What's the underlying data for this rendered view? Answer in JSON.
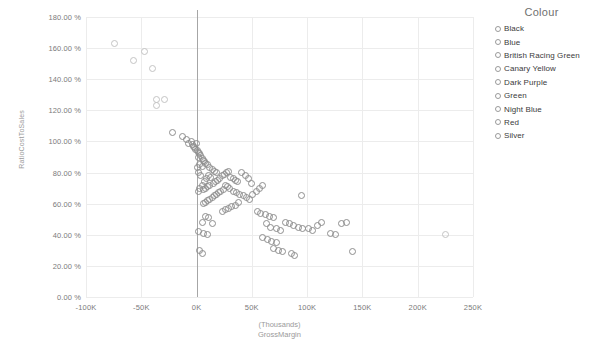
{
  "legend": {
    "title": "Colour",
    "items": [
      {
        "label": "Black"
      },
      {
        "label": "Blue"
      },
      {
        "label": "British Racing Green"
      },
      {
        "label": "Canary Yellow"
      },
      {
        "label": "Dark Purple"
      },
      {
        "label": "Green"
      },
      {
        "label": "Night Blue"
      },
      {
        "label": "Red"
      },
      {
        "label": "Silver"
      }
    ]
  },
  "axis": {
    "y_title": "RatioCostToSales",
    "x_title_line1": "(Thousands)",
    "x_title_line2": "GrossMargin"
  },
  "chart_data": {
    "type": "scatter",
    "title": "",
    "xlabel": "(Thousands) GrossMargin",
    "ylabel": "RatioCostToSales",
    "xlim": [
      -100,
      250
    ],
    "ylim": [
      0,
      180
    ],
    "xticks": [
      "-100K",
      "-50K",
      "0K",
      "50K",
      "100K",
      "150K",
      "200K",
      "250K"
    ],
    "xtick_values": [
      -100,
      -50,
      0,
      50,
      100,
      150,
      200,
      250
    ],
    "yticks": [
      "0.00 %",
      "20.00 %",
      "40.00 %",
      "60.00 %",
      "80.00 %",
      "100.00 %",
      "120.00 %",
      "140.00 %",
      "160.00 %",
      "180.00 %"
    ],
    "ytick_values": [
      0,
      20,
      40,
      60,
      80,
      100,
      120,
      140,
      160,
      180
    ],
    "grid": true,
    "legend_position": "right",
    "legend_title": "Colour",
    "series": [
      {
        "name": "All colours",
        "marker": "open-circle",
        "color": "#8e8e8e",
        "points": [
          [
            -74,
            163
          ],
          [
            -57,
            152
          ],
          [
            -47,
            158
          ],
          [
            -40,
            147
          ],
          [
            -36,
            127
          ],
          [
            -36,
            123
          ],
          [
            -29,
            127
          ],
          [
            -22,
            106
          ],
          [
            -13,
            103
          ],
          [
            -9,
            101
          ],
          [
            -7,
            99
          ],
          [
            -5,
            100
          ],
          [
            -4,
            98
          ],
          [
            -3,
            97
          ],
          [
            -2,
            96
          ],
          [
            -1,
            95
          ],
          [
            0,
            99
          ],
          [
            1,
            94
          ],
          [
            2,
            93
          ],
          [
            2,
            90
          ],
          [
            3,
            92
          ],
          [
            4,
            91
          ],
          [
            5,
            89
          ],
          [
            6,
            88
          ],
          [
            7,
            87
          ],
          [
            3,
            85
          ],
          [
            5,
            84
          ],
          [
            1,
            83
          ],
          [
            2,
            80
          ],
          [
            4,
            78
          ],
          [
            8,
            86
          ],
          [
            10,
            85
          ],
          [
            12,
            83
          ],
          [
            14,
            82
          ],
          [
            16,
            81
          ],
          [
            18,
            80
          ],
          [
            11,
            78
          ],
          [
            13,
            77
          ],
          [
            9,
            76
          ],
          [
            7,
            74
          ],
          [
            5,
            72
          ],
          [
            3,
            70
          ],
          [
            2,
            68
          ],
          [
            6,
            69
          ],
          [
            8,
            70
          ],
          [
            10,
            71
          ],
          [
            12,
            72
          ],
          [
            15,
            73
          ],
          [
            17,
            74
          ],
          [
            19,
            75
          ],
          [
            21,
            76
          ],
          [
            23,
            78
          ],
          [
            25,
            79
          ],
          [
            27,
            80
          ],
          [
            29,
            81
          ],
          [
            31,
            77
          ],
          [
            33,
            76
          ],
          [
            35,
            75
          ],
          [
            37,
            74
          ],
          [
            26,
            72
          ],
          [
            28,
            71
          ],
          [
            30,
            70
          ],
          [
            24,
            69
          ],
          [
            22,
            68
          ],
          [
            20,
            67
          ],
          [
            18,
            66
          ],
          [
            16,
            65
          ],
          [
            14,
            64
          ],
          [
            12,
            63
          ],
          [
            10,
            62
          ],
          [
            8,
            61
          ],
          [
            6,
            60
          ],
          [
            33,
            68
          ],
          [
            36,
            67
          ],
          [
            39,
            66
          ],
          [
            42,
            65
          ],
          [
            45,
            64
          ],
          [
            48,
            63
          ],
          [
            51,
            66
          ],
          [
            54,
            68
          ],
          [
            57,
            70
          ],
          [
            60,
            72
          ],
          [
            50,
            73
          ],
          [
            47,
            76
          ],
          [
            44,
            78
          ],
          [
            41,
            80
          ],
          [
            38,
            61
          ],
          [
            35,
            59
          ],
          [
            32,
            58
          ],
          [
            29,
            57
          ],
          [
            26,
            56
          ],
          [
            23,
            55
          ],
          [
            8,
            52
          ],
          [
            11,
            51
          ],
          [
            5,
            48
          ],
          [
            14,
            47
          ],
          [
            2,
            42
          ],
          [
            6,
            41
          ],
          [
            10,
            40
          ],
          [
            3,
            30
          ],
          [
            5,
            28
          ],
          [
            55,
            55
          ],
          [
            58,
            54
          ],
          [
            62,
            53
          ],
          [
            66,
            52
          ],
          [
            70,
            51
          ],
          [
            63,
            47
          ],
          [
            67,
            45
          ],
          [
            72,
            44
          ],
          [
            76,
            43
          ],
          [
            60,
            38
          ],
          [
            64,
            37
          ],
          [
            68,
            36
          ],
          [
            72,
            35
          ],
          [
            70,
            31
          ],
          [
            74,
            30
          ],
          [
            78,
            29
          ],
          [
            86,
            28
          ],
          [
            89,
            27
          ],
          [
            80,
            48
          ],
          [
            84,
            47
          ],
          [
            88,
            46
          ],
          [
            92,
            45
          ],
          [
            96,
            44
          ],
          [
            95,
            65
          ],
          [
            101,
            44
          ],
          [
            105,
            43
          ],
          [
            109,
            46
          ],
          [
            113,
            48
          ],
          [
            121,
            41
          ],
          [
            126,
            40
          ],
          [
            131,
            47
          ],
          [
            136,
            48
          ],
          [
            141,
            29
          ],
          [
            225,
            40
          ]
        ]
      }
    ]
  }
}
